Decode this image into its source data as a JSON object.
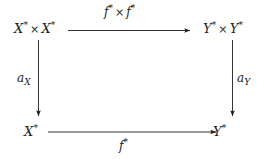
{
  "diagram": {
    "type": "commutative-square",
    "background_color": "#ffffff",
    "ink_color": "#1d1d1d",
    "nodes": {
      "top_left": {
        "base": "X",
        "superscript": "*",
        "operator": "×",
        "base2": "X",
        "superscript2": "*",
        "plain": "X* × X*"
      },
      "top_right": {
        "base": "Y",
        "superscript": "*",
        "operator": "×",
        "base2": "Y",
        "superscript2": "*",
        "plain": "Y* × Y*"
      },
      "bottom_left": {
        "base": "X",
        "superscript": "*",
        "plain": "X*"
      },
      "bottom_right": {
        "base": "Y",
        "superscript": "*",
        "plain": "Y*"
      }
    },
    "arrows": {
      "top": {
        "direction": "right",
        "from": "top_left",
        "to": "top_right",
        "label": {
          "base": "f",
          "superscript": "*",
          "operator": "×",
          "base2": "f",
          "superscript2": "*",
          "plain": "f* × f*"
        }
      },
      "bottom": {
        "direction": "right",
        "from": "bottom_left",
        "to": "bottom_right",
        "label": {
          "base": "f",
          "superscript": "*",
          "plain": "f*"
        }
      },
      "left": {
        "direction": "down",
        "from": "top_left",
        "to": "bottom_left",
        "label": {
          "base": "a",
          "subscript": "X",
          "plain": "a_X"
        }
      },
      "right": {
        "direction": "down",
        "from": "top_right",
        "to": "bottom_right",
        "label": {
          "base": "a",
          "subscript": "Y",
          "plain": "a_Y"
        }
      }
    }
  }
}
